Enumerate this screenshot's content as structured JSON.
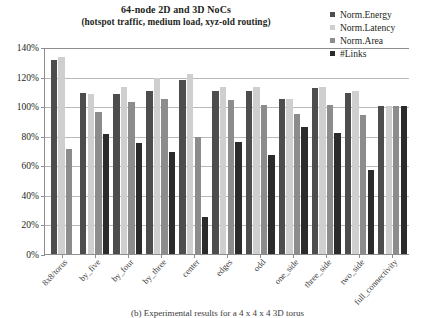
{
  "chart_data": {
    "type": "bar",
    "title": "64-node 2D and 3D NoCs",
    "subtitle": "(hotspot traffic, medium load, xyz-old routing)",
    "xlabel": "",
    "ylabel": "",
    "ylim": [
      0,
      140
    ],
    "ytick_labels": [
      "0%",
      "20%",
      "40%",
      "60%",
      "80%",
      "100%",
      "120%",
      "140%"
    ],
    "ytick_values": [
      0,
      20,
      40,
      60,
      80,
      100,
      120,
      140
    ],
    "grid": true,
    "legend_position": "top-right",
    "categories": [
      "8x8/torus",
      "by_five",
      "by_four",
      "by_three",
      "center",
      "edges",
      "odd",
      "one_side",
      "three_side",
      "two_side",
      "full_connectivity"
    ],
    "series": [
      {
        "name": "Norm.Energy",
        "color": "#4d4d4d",
        "values": [
          131,
          109,
          108,
          110,
          118,
          110,
          110,
          105,
          112,
          109,
          100
        ]
      },
      {
        "name": "Norm.Latency",
        "color": "#cfcfcf",
        "values": [
          133,
          108,
          113,
          119,
          122,
          113,
          113,
          105,
          113,
          110,
          100
        ]
      },
      {
        "name": "Norm.Area",
        "color": "#8c8c8c",
        "values": [
          71,
          96,
          103,
          105,
          79,
          104,
          101,
          95,
          101,
          94,
          100
        ]
      },
      {
        "name": "#Links",
        "color": "#2b2b2b",
        "values": [
          null,
          81,
          75,
          69,
          25,
          76,
          67,
          86,
          82,
          57,
          100
        ]
      }
    ]
  },
  "caption": "(b) Experimental results for a 4 x 4 x 4 3D torus"
}
